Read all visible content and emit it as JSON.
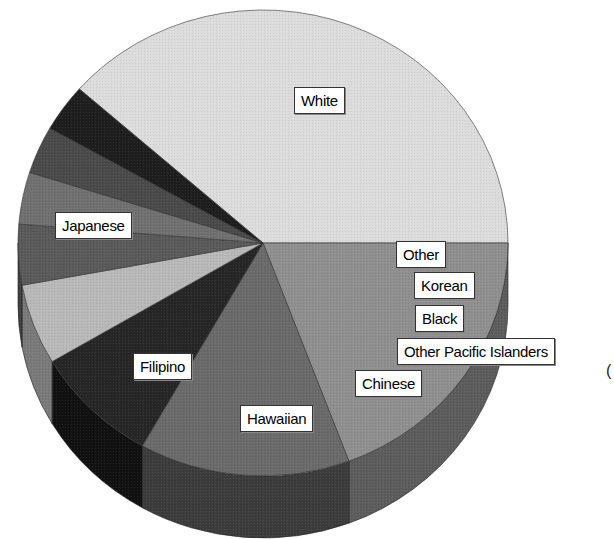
{
  "chart_data": {
    "type": "pie",
    "style": "3d",
    "title": "",
    "categories": [
      "White",
      "Japanese",
      "Filipino",
      "Hawaiian",
      "Chinese",
      "Other Pacific Islanders",
      "Black",
      "Korean",
      "Other"
    ],
    "values": [
      38.5,
      19.3,
      13.9,
      8.3,
      5.6,
      4.2,
      3.6,
      3.3,
      3.3
    ],
    "unit": "percent (estimated from slice angles)",
    "colors": [
      "#dcdcdc",
      "#8f8f8f",
      "#6a6a6a",
      "#262626",
      "#b8b8b8",
      "#5a5a5a",
      "#707070",
      "#4a4a4a",
      "#1e1e1e"
    ],
    "side_colors": [
      "#c4c4c4",
      "#5c5c5c",
      "#3c3c3c",
      "#111111",
      "#7a7a7a",
      "#404040",
      "#4a4a4a",
      "#303030",
      "#151515"
    ],
    "legend": "none",
    "data_labels": "category names in boxed callouts"
  },
  "labels": {
    "white": "White",
    "japanese": "Japanese",
    "filipino": "Filipino",
    "hawaiian": "Hawaiian",
    "chinese": "Chinese",
    "other_pacific_islanders": "Other Pacific Islanders",
    "black": "Black",
    "korean": "Korean",
    "other": "Other"
  },
  "edge_glyph": "("
}
